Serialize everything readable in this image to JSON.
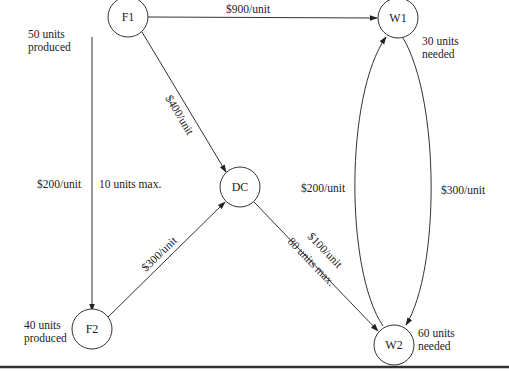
{
  "nodes": {
    "F1": {
      "label": "F1",
      "note_line1": "50 units",
      "note_line2": "produced"
    },
    "F2": {
      "label": "F2",
      "note_line1": "40 units",
      "note_line2": "produced"
    },
    "DC": {
      "label": "DC"
    },
    "W1": {
      "label": "W1",
      "note_line1": "30 units",
      "note_line2": "needed"
    },
    "W2": {
      "label": "W2",
      "note_line1": "60 units",
      "note_line2": "needed"
    }
  },
  "edges": {
    "F1_W1": {
      "from": "F1",
      "to": "W1",
      "cost": "$900/unit"
    },
    "F1_DC": {
      "from": "F1",
      "to": "DC",
      "cost": "$400/unit"
    },
    "F1_F2": {
      "from": "F1",
      "to": "F2",
      "cost": "$200/unit",
      "capacity": "10 units max."
    },
    "F2_DC": {
      "from": "F2",
      "to": "DC",
      "cost": "$300/unit"
    },
    "DC_W2": {
      "from": "DC",
      "to": "W2",
      "cost": "$100/unit",
      "capacity": "80 units max."
    },
    "W2_W1": {
      "from": "W2",
      "to": "W1",
      "cost": "$200/unit"
    },
    "W1_W2": {
      "from": "W1",
      "to": "W2",
      "cost": "$300/unit"
    }
  }
}
